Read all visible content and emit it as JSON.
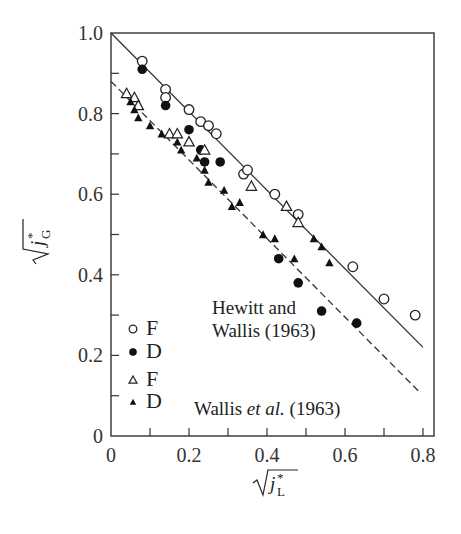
{
  "chart_data": {
    "type": "scatter",
    "title": "",
    "xlabel": "√j*_L",
    "ylabel": "√j*_G",
    "xlim": [
      0,
      0.83
    ],
    "ylim": [
      0,
      1.0
    ],
    "x_ticks": [
      "0",
      "0.2",
      "0.4",
      "0.6",
      "0.8"
    ],
    "y_ticks": [
      "0",
      "0.2",
      "0.4",
      "0.6",
      "0.8",
      "1.0"
    ],
    "grid": false,
    "legend_position": "lower-left",
    "legend": [
      {
        "marker": "open-circle",
        "label": "F"
      },
      {
        "marker": "filled-circle",
        "label": "D"
      },
      {
        "marker": "open-triangle",
        "label": "F"
      },
      {
        "marker": "filled-triangle",
        "label": "D"
      }
    ],
    "annotations": [
      {
        "text": "Hewitt and",
        "x": 0.23,
        "y": 0.32
      },
      {
        "text": "Wallis (1963)",
        "x": 0.23,
        "y": 0.26
      },
      {
        "text": "Wallis",
        "x": 0.24,
        "y": 0.1,
        "suffix_italic": "et al.",
        "suffix": "(1963)"
      }
    ],
    "lines": [
      {
        "name": "Hewitt and Wallis (1963)",
        "style": "solid",
        "x": [
          0,
          0.8
        ],
        "y": [
          1.0,
          0.22
        ]
      },
      {
        "name": "Wallis et al. (1963)",
        "style": "dashed",
        "x": [
          0,
          0.79
        ],
        "y": [
          0.88,
          0.11
        ]
      }
    ],
    "series": [
      {
        "name": "Hewitt and Wallis F",
        "marker": "open-circle",
        "x": [
          0.08,
          0.14,
          0.14,
          0.2,
          0.23,
          0.25,
          0.27,
          0.34,
          0.35,
          0.42,
          0.48,
          0.62,
          0.7,
          0.78
        ],
        "y": [
          0.93,
          0.86,
          0.84,
          0.81,
          0.78,
          0.77,
          0.75,
          0.65,
          0.66,
          0.6,
          0.55,
          0.42,
          0.34,
          0.3
        ]
      },
      {
        "name": "Hewitt and Wallis D",
        "marker": "filled-circle",
        "x": [
          0.08,
          0.14,
          0.2,
          0.23,
          0.24,
          0.28,
          0.43,
          0.48,
          0.54,
          0.63
        ],
        "y": [
          0.91,
          0.82,
          0.76,
          0.71,
          0.68,
          0.68,
          0.44,
          0.38,
          0.31,
          0.28
        ]
      },
      {
        "name": "Wallis et al. F",
        "marker": "open-triangle",
        "x": [
          0.04,
          0.06,
          0.07,
          0.15,
          0.17,
          0.2,
          0.24,
          0.36,
          0.45,
          0.48
        ],
        "y": [
          0.85,
          0.84,
          0.82,
          0.75,
          0.75,
          0.73,
          0.71,
          0.62,
          0.57,
          0.53
        ]
      },
      {
        "name": "Wallis et al. D",
        "marker": "filled-triangle",
        "x": [
          0.05,
          0.06,
          0.07,
          0.1,
          0.13,
          0.17,
          0.18,
          0.22,
          0.24,
          0.25,
          0.29,
          0.31,
          0.33,
          0.39,
          0.42,
          0.47,
          0.52,
          0.54,
          0.56
        ],
        "y": [
          0.83,
          0.81,
          0.79,
          0.77,
          0.75,
          0.73,
          0.71,
          0.69,
          0.66,
          0.63,
          0.61,
          0.57,
          0.58,
          0.5,
          0.49,
          0.44,
          0.49,
          0.47,
          0.43
        ]
      }
    ]
  }
}
